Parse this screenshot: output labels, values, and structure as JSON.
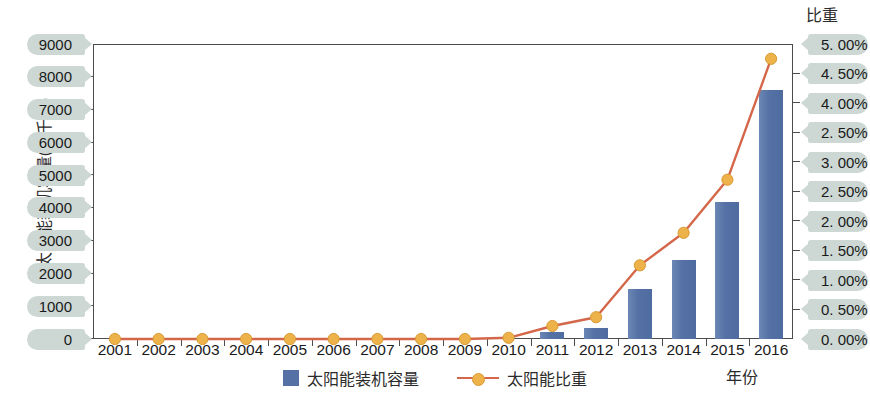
{
  "chart_data": {
    "type": "bar",
    "title": "",
    "xlabel": "年份",
    "ylabel": "太阳能装机容量(万千瓦)",
    "y2label": "比重",
    "categories": [
      "2001",
      "2002",
      "2003",
      "2004",
      "2005",
      "2006",
      "2007",
      "2008",
      "2009",
      "2010",
      "2011",
      "2012",
      "2013",
      "2014",
      "2015",
      "2016"
    ],
    "ylim": [
      0,
      9000
    ],
    "y2lim": [
      0,
      5.0
    ],
    "grid": false,
    "legend_position": "bottom-center",
    "series": [
      {
        "name": "太阳能装机容量",
        "type": "bar",
        "axis": "left",
        "unit": "万千瓦",
        "color": "#5470a4",
        "values": [
          0,
          0,
          0,
          0,
          0,
          0,
          0,
          0,
          0,
          0,
          220,
          340,
          1540,
          2400,
          4180,
          7600
        ]
      },
      {
        "name": "太阳能比重",
        "type": "line",
        "axis": "right",
        "unit": "%",
        "color": "#d4674a",
        "marker_color": "#eeb24b",
        "values": [
          0.0,
          0.0,
          0.0,
          0.0,
          0.0,
          0.0,
          0.0,
          0.0,
          0.0,
          0.02,
          0.22,
          0.37,
          1.25,
          1.8,
          2.7,
          4.75
        ]
      }
    ],
    "y_tick_labels": [
      "9000",
      "8000",
      "7000",
      "6000",
      "5000",
      "4000",
      "3000",
      "2000",
      "1000",
      "0"
    ],
    "y_tick_values": [
      9000,
      8000,
      7000,
      6000,
      5000,
      4000,
      3000,
      2000,
      1000,
      0
    ],
    "y2_tick_labels": [
      "5. 00%",
      "4. 50%",
      "4. 00%",
      "2. 50%",
      "3. 00%",
      "2. 50%",
      "2. 00%",
      "1. 50%",
      "1. 00%",
      "0. 50%",
      "0. 00%"
    ],
    "y2_tick_values": [
      5.0,
      4.5,
      4.0,
      3.5,
      3.0,
      2.5,
      2.0,
      1.5,
      1.0,
      0.5,
      0.0
    ]
  },
  "axes": {
    "left_title": "太阳能装机容量(万千瓦)",
    "right_title": "比重",
    "bottom_title": "年份"
  },
  "legend": {
    "items": [
      {
        "label": "太阳能装机容量",
        "marker": "square-swatch"
      },
      {
        "label": "太阳能比重",
        "marker": "line-with-dot"
      }
    ]
  },
  "colors": {
    "bar": "#5470a4",
    "line": "#d4674a",
    "marker": "#eeb24b",
    "pill_bg": "#cdd8d4",
    "axis": "#4c4c4c",
    "text": "#1a1a1a",
    "background": "#ffffff"
  }
}
